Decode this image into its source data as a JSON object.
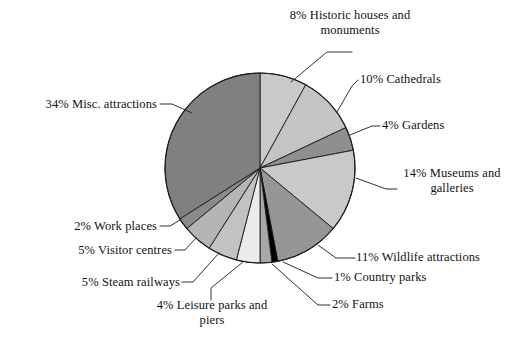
{
  "chart_data": {
    "type": "pie",
    "title": "",
    "subtitle": "",
    "xlabel": "",
    "ylabel": "",
    "legend_position": "callout-labels",
    "grid": false,
    "units": "percent",
    "total": 100,
    "start_angle_deg": 0,
    "direction": "clockwise",
    "categories": [
      "Historic houses and monuments",
      "Cathedrals",
      "Gardens",
      "Museums and galleries",
      "Wildlife attractions",
      "Country parks",
      "Farms",
      "Leisure parks and piers",
      "Steam railways",
      "Visitor centres",
      "Work places",
      "Misc. attractions"
    ],
    "values": [
      8,
      10,
      4,
      14,
      11,
      1,
      2,
      4,
      5,
      5,
      2,
      34
    ],
    "colors": [
      "#c9c9c9",
      "#c4c4c4",
      "#8f8f8f",
      "#c9c9c9",
      "#969696",
      "#000000",
      "#a8a8a8",
      "#ebebeb",
      "#c2c2c2",
      "#b5b5b5",
      "#8a8a8a",
      "#808080"
    ],
    "slices": [
      {
        "label": "8% Historic houses and\nmonuments",
        "name": "Historic houses and monuments",
        "percent": 8,
        "color": "#c9c9c9"
      },
      {
        "label": "10% Cathedrals",
        "name": "Cathedrals",
        "percent": 10,
        "color": "#c4c4c4"
      },
      {
        "label": "4% Gardens",
        "name": "Gardens",
        "percent": 4,
        "color": "#8f8f8f"
      },
      {
        "label": "14% Museums and\ngalleries",
        "name": "Museums and galleries",
        "percent": 14,
        "color": "#c9c9c9"
      },
      {
        "label": "11% Wildlife attractions",
        "name": "Wildlife attractions",
        "percent": 11,
        "color": "#969696"
      },
      {
        "label": "1% Country parks",
        "name": "Country parks",
        "percent": 1,
        "color": "#000000"
      },
      {
        "label": "2% Farms",
        "name": "Farms",
        "percent": 2,
        "color": "#a8a8a8"
      },
      {
        "label": "4% Leisure parks and\npiers",
        "name": "Leisure parks and piers",
        "percent": 4,
        "color": "#ebebeb"
      },
      {
        "label": "5% Steam railways",
        "name": "Steam railways",
        "percent": 5,
        "color": "#c2c2c2"
      },
      {
        "label": "5% Visitor centres",
        "name": "Visitor centres",
        "percent": 5,
        "color": "#b5b5b5"
      },
      {
        "label": "2% Work places",
        "name": "Work places",
        "percent": 2,
        "color": "#8a8a8a"
      },
      {
        "label": "34% Misc. attractions",
        "name": "Misc. attractions",
        "percent": 34,
        "color": "#808080"
      }
    ]
  },
  "labels": {
    "historic_houses": "8% Historic houses and\nmonuments",
    "cathedrals": "10% Cathedrals",
    "gardens": "4% Gardens",
    "museums": "14% Museums and\ngalleries",
    "wildlife": "11% Wildlife attractions",
    "country_parks": "1% Country parks",
    "farms": "2% Farms",
    "leisure_parks": "4% Leisure parks and\npiers",
    "steam_railways": "5% Steam railways",
    "visitor_centres": "5% Visitor centres",
    "work_places": "2% Work places",
    "misc_attractions": "34% Misc. attractions"
  },
  "style": {
    "background": "#ffffff",
    "text_color": "#111111",
    "outline_color": "#1a1a1a"
  }
}
